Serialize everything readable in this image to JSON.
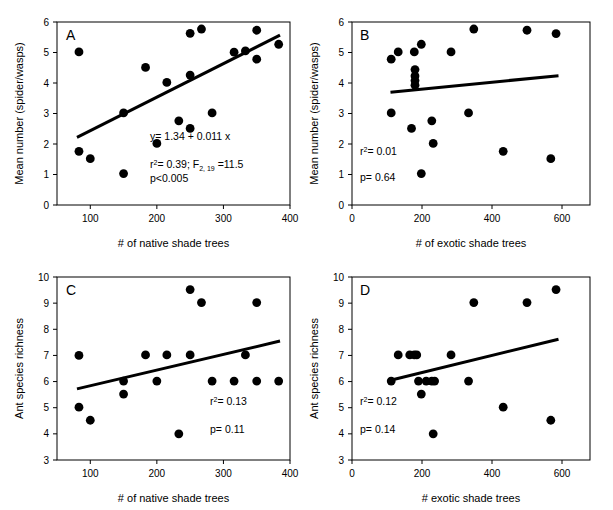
{
  "figure": {
    "title": "",
    "panel_count": 4,
    "marker_color": "#000000",
    "line_color": "#000000",
    "background": "#ffffff"
  },
  "chart_data": [
    {
      "type": "scatter",
      "panel": "A",
      "title": "",
      "xlabel": "# of native shade trees",
      "ylabel": "Mean number (spider/wasps)",
      "xlim": [
        50,
        400
      ],
      "ylim": [
        0,
        6
      ],
      "xticks": [
        100,
        200,
        300,
        400
      ],
      "yticks": [
        0,
        1,
        2,
        3,
        4,
        5,
        6
      ],
      "grid": false,
      "legend": "none",
      "points": [
        {
          "x": 83,
          "y": 5.02
        },
        {
          "x": 83,
          "y": 1.76
        },
        {
          "x": 100,
          "y": 1.52
        },
        {
          "x": 150,
          "y": 3.02
        },
        {
          "x": 150,
          "y": 1.03
        },
        {
          "x": 183,
          "y": 4.51
        },
        {
          "x": 200,
          "y": 2.02
        },
        {
          "x": 215,
          "y": 4.02
        },
        {
          "x": 233,
          "y": 2.76
        },
        {
          "x": 250,
          "y": 5.63
        },
        {
          "x": 250,
          "y": 4.26
        },
        {
          "x": 250,
          "y": 2.51
        },
        {
          "x": 267,
          "y": 5.77
        },
        {
          "x": 283,
          "y": 3.02
        },
        {
          "x": 316,
          "y": 5.01
        },
        {
          "x": 333,
          "y": 5.05
        },
        {
          "x": 350,
          "y": 5.73
        },
        {
          "x": 350,
          "y": 4.78
        },
        {
          "x": 383,
          "y": 5.27
        }
      ],
      "fit_line": {
        "x1": 80,
        "y1": 2.22,
        "x2": 385,
        "y2": 5.57
      },
      "annotations": [
        {
          "text": "y= 1.34 + 0.011 x"
        },
        {
          "text": "r²= 0.39; F2, 19 =11.5"
        },
        {
          "text": "p<0.005"
        }
      ],
      "equation": "y= 1.34 + 0.011 x",
      "r_squared": "r²= 0.39",
      "f_stat": "F2, 19 =11.5",
      "p_value": "p<0.005"
    },
    {
      "type": "scatter",
      "panel": "B",
      "title": "",
      "xlabel": "# of exotic shade trees",
      "ylabel": "Mean number (spider/wasps)",
      "xlim": [
        0,
        680
      ],
      "ylim": [
        0,
        6
      ],
      "xticks": [
        0,
        200,
        400,
        600
      ],
      "yticks": [
        0,
        1,
        2,
        3,
        4,
        5,
        6
      ],
      "grid": false,
      "legend": "none",
      "points": [
        {
          "x": 112,
          "y": 4.78
        },
        {
          "x": 112,
          "y": 3.02
        },
        {
          "x": 132,
          "y": 5.02
        },
        {
          "x": 170,
          "y": 2.51
        },
        {
          "x": 178,
          "y": 5.02
        },
        {
          "x": 180,
          "y": 4.44
        },
        {
          "x": 180,
          "y": 4.23
        },
        {
          "x": 180,
          "y": 4.08
        },
        {
          "x": 180,
          "y": 3.93
        },
        {
          "x": 198,
          "y": 5.27
        },
        {
          "x": 198,
          "y": 1.03
        },
        {
          "x": 228,
          "y": 2.76
        },
        {
          "x": 232,
          "y": 2.02
        },
        {
          "x": 283,
          "y": 5.02
        },
        {
          "x": 333,
          "y": 3.02
        },
        {
          "x": 348,
          "y": 5.77
        },
        {
          "x": 432,
          "y": 1.76
        },
        {
          "x": 500,
          "y": 5.73
        },
        {
          "x": 568,
          "y": 1.52
        },
        {
          "x": 583,
          "y": 5.62
        }
      ],
      "fit_line": {
        "x1": 110,
        "y1": 3.7,
        "x2": 590,
        "y2": 4.24
      },
      "annotations": [
        {
          "text": "r²= 0.01"
        },
        {
          "text": "p= 0.64"
        }
      ],
      "r_squared": "r²= 0.01",
      "p_value": "p= 0.64"
    },
    {
      "type": "scatter",
      "panel": "C",
      "title": "",
      "xlabel": "# of native shade trees",
      "ylabel": "Ant species richness",
      "xlim": [
        50,
        400
      ],
      "ylim": [
        3,
        10
      ],
      "xticks": [
        100,
        200,
        300,
        400
      ],
      "yticks": [
        3,
        4,
        5,
        6,
        7,
        8,
        9,
        10
      ],
      "grid": false,
      "legend": "none",
      "points": [
        {
          "x": 83,
          "y": 7.0
        },
        {
          "x": 83,
          "y": 5.02
        },
        {
          "x": 100,
          "y": 4.52
        },
        {
          "x": 150,
          "y": 6.02
        },
        {
          "x": 150,
          "y": 5.52
        },
        {
          "x": 183,
          "y": 7.02
        },
        {
          "x": 200,
          "y": 6.02
        },
        {
          "x": 215,
          "y": 7.02
        },
        {
          "x": 233,
          "y": 4.0
        },
        {
          "x": 250,
          "y": 9.52
        },
        {
          "x": 250,
          "y": 7.02
        },
        {
          "x": 267,
          "y": 9.02
        },
        {
          "x": 283,
          "y": 6.02
        },
        {
          "x": 316,
          "y": 6.02
        },
        {
          "x": 333,
          "y": 7.02
        },
        {
          "x": 350,
          "y": 9.02
        },
        {
          "x": 350,
          "y": 6.02
        },
        {
          "x": 383,
          "y": 6.02
        }
      ],
      "fit_line": {
        "x1": 80,
        "y1": 5.72,
        "x2": 385,
        "y2": 7.55
      },
      "annotations": [
        {
          "text": "r²= 0.13"
        },
        {
          "text": "p= 0.11"
        }
      ],
      "r_squared": "r²= 0.13",
      "p_value": "p= 0.11"
    },
    {
      "type": "scatter",
      "panel": "D",
      "title": "",
      "xlabel": "# exotic shade trees",
      "ylabel": "Ant species richness",
      "xlim": [
        0,
        680
      ],
      "ylim": [
        3,
        10
      ],
      "xticks": [
        0,
        200,
        400,
        600
      ],
      "yticks": [
        3,
        4,
        5,
        6,
        7,
        8,
        9,
        10
      ],
      "grid": false,
      "legend": "none",
      "points": [
        {
          "x": 112,
          "y": 6.02
        },
        {
          "x": 132,
          "y": 7.02
        },
        {
          "x": 165,
          "y": 7.02
        },
        {
          "x": 178,
          "y": 7.02
        },
        {
          "x": 185,
          "y": 7.02
        },
        {
          "x": 190,
          "y": 6.02
        },
        {
          "x": 198,
          "y": 5.52
        },
        {
          "x": 212,
          "y": 6.02
        },
        {
          "x": 228,
          "y": 6.02
        },
        {
          "x": 236,
          "y": 6.02
        },
        {
          "x": 232,
          "y": 4.0
        },
        {
          "x": 283,
          "y": 7.02
        },
        {
          "x": 333,
          "y": 6.02
        },
        {
          "x": 348,
          "y": 9.02
        },
        {
          "x": 432,
          "y": 5.02
        },
        {
          "x": 500,
          "y": 9.02
        },
        {
          "x": 568,
          "y": 4.52
        },
        {
          "x": 583,
          "y": 9.52
        }
      ],
      "fit_line": {
        "x1": 110,
        "y1": 6.05,
        "x2": 590,
        "y2": 7.62
      },
      "annotations": [
        {
          "text": "r²= 0.12"
        },
        {
          "text": "p= 0.14"
        }
      ],
      "r_squared": "r²= 0.12",
      "p_value": "p= 0.14"
    }
  ]
}
